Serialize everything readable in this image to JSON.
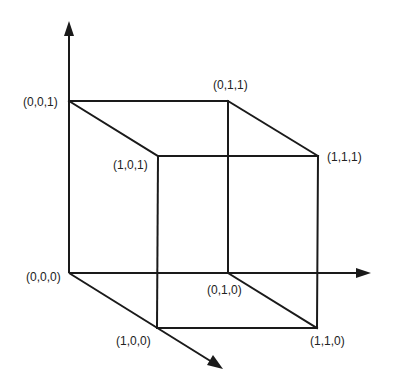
{
  "diagram": {
    "vertices": {
      "v000": {
        "label": "(0,0,0)"
      },
      "v001": {
        "label": "(0,0,1)"
      },
      "v010": {
        "label": "(0,1,0)"
      },
      "v011": {
        "label": "(0,1,1)"
      },
      "v100": {
        "label": "(1,0,0)"
      },
      "v101": {
        "label": "(1,0,1)"
      },
      "v110": {
        "label": "(1,1,0)"
      },
      "v111": {
        "label": "(1,1,1)"
      }
    },
    "axes": [
      {
        "name": "x-axis",
        "direction": "diagonal down-right"
      },
      {
        "name": "y-axis",
        "direction": "horizontal right"
      },
      {
        "name": "z-axis",
        "direction": "vertical up"
      }
    ],
    "colors": {
      "line": "#1a1a1a",
      "text": "#222222",
      "background": "#ffffff"
    }
  }
}
